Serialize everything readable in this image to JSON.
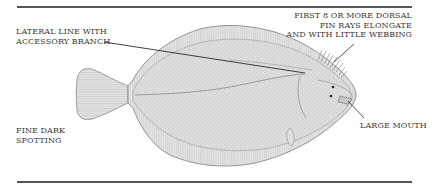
{
  "figure": {
    "colors": {
      "rule": "#555555",
      "text": "#3a3a3a",
      "fish_fill": "#dcdcdc",
      "fish_outline": "#8a8a8a",
      "leader": "#2b2b2b"
    },
    "labels": {
      "lateral_line": {
        "lines": [
          "LATERAL LINE WITH",
          "ACCESSORY BRANCH"
        ]
      },
      "dorsal_fin": {
        "lines": [
          "FIRST 8 OR MORE DORSAL",
          "FIN RAYS ELONGATE",
          "AND WITH LITTLE WEBBING"
        ]
      },
      "spotting": {
        "lines": [
          "FINE DARK",
          "SPOTTING"
        ]
      },
      "mouth": {
        "lines": [
          "LARGE MOUTH"
        ]
      }
    }
  }
}
